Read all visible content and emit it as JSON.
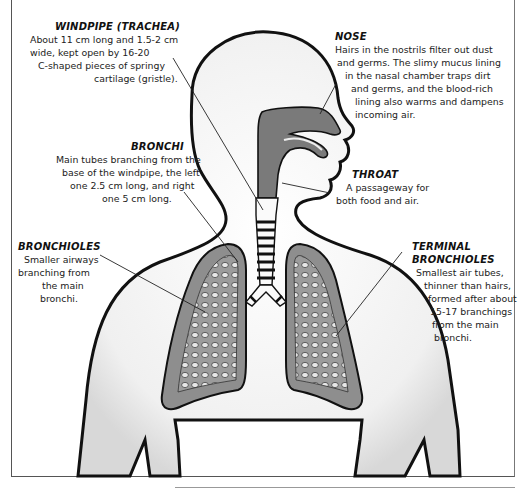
{
  "diagram": {
    "labels": {
      "windpipe": {
        "title": "WINDPIPE (TRACHEA)",
        "lines": [
          "About 11 cm long and 1.5-2 cm",
          "wide, kept open by 16-20",
          "C-shaped pieces of springy",
          "cartilage (gristle)."
        ]
      },
      "nose": {
        "title": "NOSE",
        "lines": [
          "Hairs in the nostrils filter out dust",
          "and germs. The slimy mucus lining",
          "in the nasal chamber traps dirt",
          "and germs, and the blood-rich",
          "lining also warms and dampens",
          "incoming air."
        ]
      },
      "bronchi": {
        "title": "BRONCHI",
        "lines": [
          "Main tubes branching from the",
          "base of the windpipe, the left",
          "one 2.5 cm long, and right",
          "one 5 cm long."
        ]
      },
      "throat": {
        "title": "THROAT",
        "lines": [
          "A passageway for",
          "both food and air."
        ]
      },
      "bronchioles": {
        "title": "BRONCHIOLES",
        "lines": [
          "Smaller airways",
          "branching from",
          "the main",
          "bronchi."
        ]
      },
      "terminal_bronchioles": {
        "title_line1": "TERMINAL",
        "title_line2": "BRONCHIOLES",
        "lines": [
          "Smallest air tubes,",
          "thinner than hairs,",
          "formed after about",
          "15-17 branchings",
          "from the main",
          "bronchi."
        ]
      }
    },
    "colors": {
      "outline": "#111111",
      "airway_fill": "#7a7a7a",
      "lung_fill": "#9a9a9a",
      "body_fill": "#f2f2f2",
      "background": "#ffffff"
    }
  }
}
